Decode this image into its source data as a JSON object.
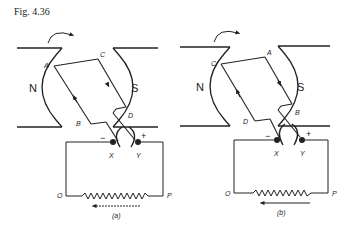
{
  "figure": {
    "title": "Fig. 4.36",
    "line_color": "#222222",
    "background": "#ffffff"
  },
  "panels": [
    {
      "caption": "(a)",
      "poles": {
        "left": "N",
        "right": "S"
      },
      "coil_corners": {
        "top_left": "A",
        "top_right": "C",
        "bottom_right": "D",
        "bottom_left": "B"
      },
      "brushes": {
        "left": "X",
        "right": "Y",
        "left_sign": "−",
        "right_sign": "+"
      },
      "circuit_ends": {
        "left": "O",
        "right": "P"
      },
      "rotation": "clockwise",
      "current_arrow": "right-to-left"
    },
    {
      "caption": "(b)",
      "poles": {
        "left": "N",
        "right": "S"
      },
      "coil_corners": {
        "top_left": "C",
        "top_right": "A",
        "bottom_right": "B",
        "bottom_left": "D"
      },
      "brushes": {
        "left": "X",
        "right": "Y",
        "left_sign": "−",
        "right_sign": "+"
      },
      "circuit_ends": {
        "left": "O",
        "right": "P"
      },
      "rotation": "clockwise",
      "current_arrow": "right-to-left"
    }
  ]
}
